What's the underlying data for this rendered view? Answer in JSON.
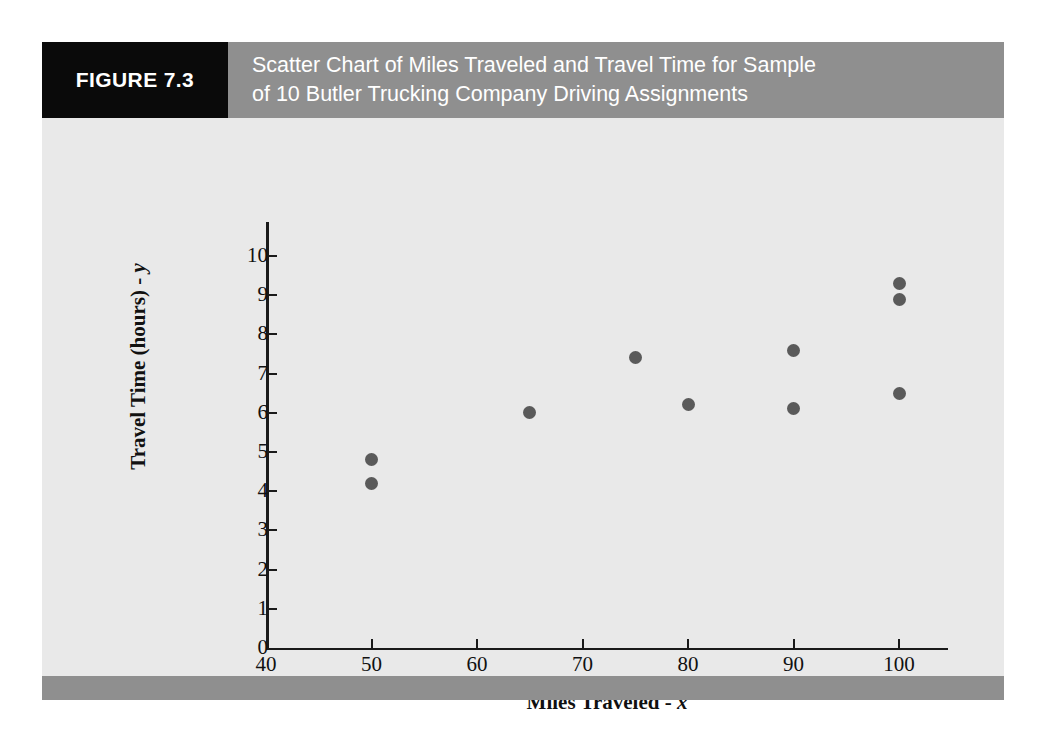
{
  "figure": {
    "badge_label": "FIGURE 7.3",
    "title_line_1": "Scatter Chart of Miles Traveled and Travel Time for Sample",
    "title_line_2": "of 10 Butler Trucking Company Driving Assignments",
    "header_bg": "#8f8f8f",
    "badge_bg": "#0a0a0a",
    "body_bg": "#e9e9e9",
    "footer_bg": "#8f8f8f"
  },
  "chart_data": {
    "type": "scatter",
    "title": "Scatter Chart of Miles Traveled and Travel Time for Sample of 10 Butler Trucking Company Driving Assignments",
    "xlabel": "Miles Traveled - x",
    "ylabel": "Travel Time (hours) - y",
    "xlabel_main": "Miles Traveled - ",
    "xlabel_var": "x",
    "ylabel_main": "Travel Time (hours) - ",
    "ylabel_var": "y",
    "xlim": [
      40,
      104
    ],
    "ylim": [
      0,
      10
    ],
    "xticks": [
      40,
      50,
      60,
      70,
      80,
      90,
      100
    ],
    "yticks": [
      0,
      1,
      2,
      3,
      4,
      5,
      6,
      7,
      8,
      9,
      10
    ],
    "grid": false,
    "legend": null,
    "marker_color": "#5a5a5a",
    "axis_color": "#1a1a1a",
    "n_points": 10,
    "x": [
      50,
      50,
      65,
      75,
      80,
      90,
      90,
      100,
      100,
      100
    ],
    "y": [
      4.8,
      4.2,
      6.0,
      7.4,
      6.2,
      7.6,
      6.1,
      9.3,
      8.9,
      6.5
    ],
    "points": [
      {
        "x": 50,
        "y": 4.8
      },
      {
        "x": 50,
        "y": 4.2
      },
      {
        "x": 65,
        "y": 6.0
      },
      {
        "x": 75,
        "y": 7.4
      },
      {
        "x": 80,
        "y": 6.2
      },
      {
        "x": 90,
        "y": 7.6
      },
      {
        "x": 90,
        "y": 6.1
      },
      {
        "x": 100,
        "y": 9.3
      },
      {
        "x": 100,
        "y": 8.9
      },
      {
        "x": 100,
        "y": 6.5
      }
    ]
  }
}
